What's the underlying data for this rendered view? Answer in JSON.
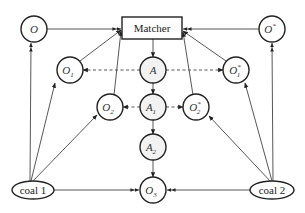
{
  "diagram": {
    "matcher": {
      "label": "Matcher"
    },
    "nodes": {
      "O": {
        "label": "O"
      },
      "O_star": {
        "label": "O",
        "sup": "*"
      },
      "O1": {
        "label": "O",
        "sub": "1"
      },
      "O1_star": {
        "label": "O",
        "sub": "1",
        "sup": "*"
      },
      "O2": {
        "label": "O",
        "sub": "2"
      },
      "O2_star": {
        "label": "O",
        "sub": "2",
        "sup": "*"
      },
      "O3": {
        "label": "O",
        "sub": "3"
      },
      "A": {
        "label": "A"
      },
      "A1": {
        "label": "A",
        "sub": "1"
      },
      "A2": {
        "label": "A",
        "sub": "2"
      }
    },
    "sources": {
      "coal1": {
        "label": "coal 1"
      },
      "coal2": {
        "label": "coal 2"
      }
    },
    "edges": [
      {
        "from": "O",
        "to": "Matcher",
        "style": "solid"
      },
      {
        "from": "O1",
        "to": "Matcher",
        "style": "solid"
      },
      {
        "from": "O2",
        "to": "Matcher",
        "style": "solid"
      },
      {
        "from": "O_star",
        "to": "Matcher",
        "style": "solid"
      },
      {
        "from": "O1_star",
        "to": "Matcher",
        "style": "solid"
      },
      {
        "from": "O2_star",
        "to": "Matcher",
        "style": "solid"
      },
      {
        "from": "Matcher",
        "to": "A",
        "style": "solid"
      },
      {
        "from": "A",
        "to": "A1",
        "style": "solid"
      },
      {
        "from": "A1",
        "to": "A2",
        "style": "solid"
      },
      {
        "from": "A2",
        "to": "O3",
        "style": "solid"
      },
      {
        "from": "A",
        "to": "O1",
        "style": "dashed"
      },
      {
        "from": "A",
        "to": "O1_star",
        "style": "dashed"
      },
      {
        "from": "A1",
        "to": "O2",
        "style": "dashed"
      },
      {
        "from": "A1",
        "to": "O2_star",
        "style": "dashed"
      },
      {
        "from": "coal1",
        "to": "O",
        "style": "solid"
      },
      {
        "from": "coal1",
        "to": "O1",
        "style": "solid"
      },
      {
        "from": "coal1",
        "to": "O2",
        "style": "solid"
      },
      {
        "from": "coal1",
        "to": "O3",
        "style": "solid"
      },
      {
        "from": "coal2",
        "to": "O_star",
        "style": "solid"
      },
      {
        "from": "coal2",
        "to": "O1_star",
        "style": "solid"
      },
      {
        "from": "coal2",
        "to": "O2_star",
        "style": "solid"
      },
      {
        "from": "coal2",
        "to": "O3",
        "style": "solid"
      }
    ]
  }
}
